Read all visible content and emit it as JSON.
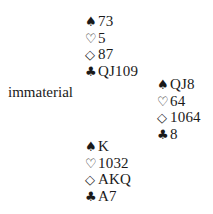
{
  "diagram": {
    "type": "bridge-deal",
    "suit_symbols": {
      "spades": "♠",
      "hearts": "♡",
      "diamonds": "◇",
      "clubs": "♣"
    },
    "north": {
      "spades": "73",
      "hearts": "5",
      "diamonds": "87",
      "clubs": "QJ109"
    },
    "west": {
      "label": "immaterial"
    },
    "east": {
      "spades": "QJ8",
      "hearts": "64",
      "diamonds": "1064",
      "clubs": "8"
    },
    "south": {
      "spades": "K",
      "hearts": "1032",
      "diamonds": "AKQ",
      "clubs": "A7"
    }
  }
}
